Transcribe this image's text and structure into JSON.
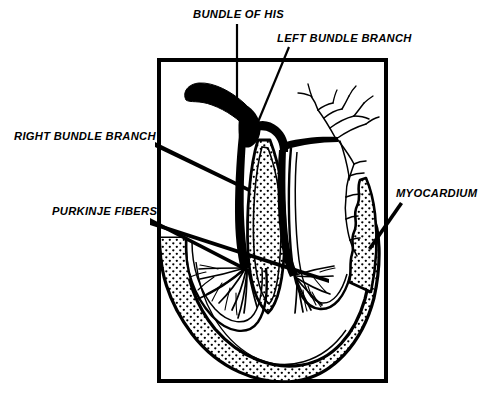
{
  "figure": {
    "background_color": "#ffffff",
    "ink_color": "#000000",
    "frame": {
      "name": "diagram-border",
      "x": 157,
      "y": 58,
      "width": 231,
      "height": 325,
      "stroke_width": 4
    }
  },
  "labels": {
    "bundle_of_his": "BUNDLE OF HIS",
    "left_bundle_branch": "LEFT BUNDLE BRANCH",
    "right_bundle_branch": "RIGHT BUNDLE BRANCH",
    "purkinje_fibers": "PURKINJE FIBERS",
    "myocardium": "MYOCARDIUM"
  },
  "callouts": [
    {
      "id": "bundle-of-his",
      "label": "BUNDLE OF HIS",
      "text_x": 193,
      "text_y": 17,
      "anchor": "start",
      "leader": "M 237,24 L 237,113"
    },
    {
      "id": "left-bundle-branch",
      "label": "LEFT BUNDLE BRANCH",
      "text_x": 277,
      "text_y": 41,
      "anchor": "start",
      "leader": "M 288,47 L 257,123"
    },
    {
      "id": "right-bundle-branch",
      "label": "RIGHT BUNDLE BRANCH",
      "text_x": 14,
      "text_y": 139,
      "anchor": "start",
      "leader": "M 155,144 L 248,190"
    },
    {
      "id": "purkinje-fibers",
      "label": "PURKINJE FIBERS",
      "text_x": 52,
      "text_y": 214,
      "anchor": "start",
      "leader_a": "M 150,220 L 248,271",
      "leader_b": "M 150,222 L 328,281"
    },
    {
      "id": "myocardium",
      "label": "MYOCARDIUM",
      "text_x": 396,
      "text_y": 196,
      "anchor": "start",
      "leader": "M 399,203 L 369,249"
    }
  ],
  "anatomy": {
    "parts": [
      {
        "id": "bundle-of-his-trunk",
        "name": "Bundle of His",
        "style": "solid-black"
      },
      {
        "id": "left-bundle-branch-path",
        "name": "Left bundle branch",
        "style": "solid-black"
      },
      {
        "id": "right-bundle-branch-path",
        "name": "Right bundle branch",
        "style": "solid-black"
      },
      {
        "id": "interventricular-septum",
        "name": "Interventricular septum",
        "style": "stippled"
      },
      {
        "id": "myocardium-wall",
        "name": "Myocardium",
        "style": "stippled"
      },
      {
        "id": "purkinje-fan-left",
        "name": "Purkinje fiber fan (left)",
        "style": "line-network"
      },
      {
        "id": "purkinje-fan-right",
        "name": "Purkinje fiber fan (right)",
        "style": "line-network"
      },
      {
        "id": "purkinje-tree-right",
        "name": "Purkinje branching tree (right wall)",
        "style": "line-network"
      }
    ]
  }
}
